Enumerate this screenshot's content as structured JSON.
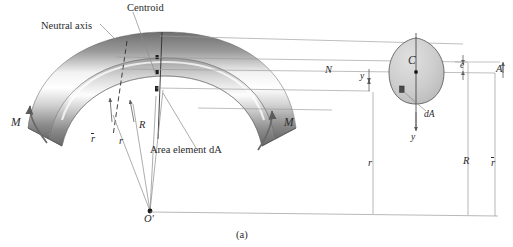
{
  "figure": {
    "caption": "(a)",
    "title_labels": {
      "centroid": "Centroid",
      "neutral_axis": "Neutral axis",
      "area_element": "Area element dA"
    },
    "beam_labels": {
      "moment_left": "M",
      "moment_right": "M",
      "radius_centroid_beam": "r",
      "radius_neutral_beam": "r",
      "radius_R_beam": "R",
      "center_of_curvature": "O'"
    },
    "section_labels": {
      "centroid_point": "C",
      "neutral_axis_point": "N",
      "distance_y_upper": "y",
      "eccentricity": "e",
      "area": "A",
      "area_element": "dA",
      "distance_y_lower": "y"
    },
    "dimension_labels": {
      "r_neutral": "r",
      "R_radius": "R",
      "r_bar_centroid": "r"
    },
    "colors": {
      "line": "#8c8c8c",
      "dark_line": "#3a3a3a",
      "text": "#2a2a2a",
      "section_fill": "#cfcfcf",
      "section_stroke": "#555555",
      "beam_light": "#fefefe",
      "beam_mid": "#b8b8b8",
      "beam_dark": "#555555"
    }
  }
}
